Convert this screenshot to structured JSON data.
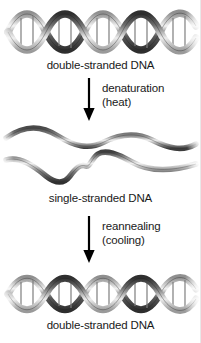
{
  "diagram": {
    "background_color": "#ffffff",
    "text_color": "#1a1a1a",
    "strand_color_dark": "#3a3a3a",
    "strand_color_light": "#d9d9d9",
    "arrow_color": "#000000"
  },
  "stages": [
    {
      "id": "stage-top",
      "graphic": "double-helix",
      "caption": "double-stranded DNA"
    },
    {
      "id": "stage-middle",
      "graphic": "separated-single-strands",
      "caption": "single-stranded DNA"
    },
    {
      "id": "stage-bottom",
      "graphic": "double-helix",
      "caption": "double-stranded DNA"
    }
  ],
  "transitions": [
    {
      "id": "transition-denaturation",
      "arrow": "down-arrow-icon",
      "line1": "denaturation",
      "line2": "(heat)"
    },
    {
      "id": "transition-reannealing",
      "arrow": "down-arrow-icon",
      "line1": "reannealing",
      "line2": "(cooling)"
    }
  ]
}
